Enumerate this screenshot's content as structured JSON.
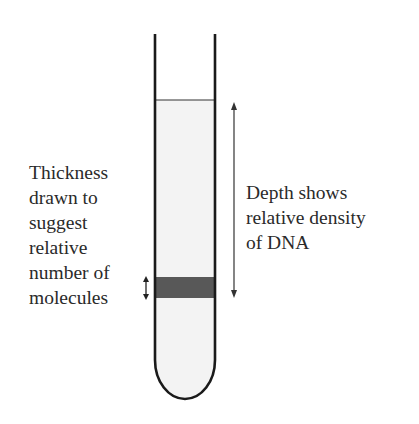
{
  "diagram": {
    "left_label": {
      "lines": [
        "Thickness",
        "drawn to",
        "suggest",
        "relative",
        "number of",
        "molecules"
      ]
    },
    "right_label": {
      "lines": [
        "Depth shows",
        "relative density",
        "of DNA"
      ]
    },
    "colors": {
      "tube_outline": "#1a1a1a",
      "liquid_fill": "#f4f4f4",
      "band": "#555555",
      "arrow": "#333333"
    }
  }
}
